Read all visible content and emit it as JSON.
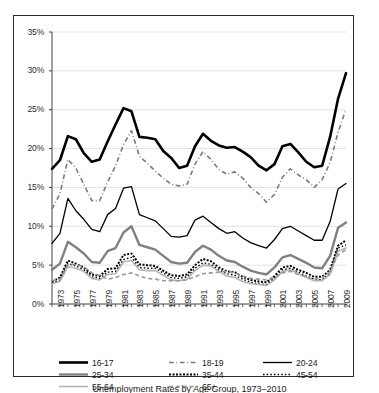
{
  "chart_data": {
    "type": "line",
    "title": "",
    "xlabel": "",
    "ylabel": "",
    "ylim": [
      0,
      35
    ],
    "xlim": [
      1973,
      2010
    ],
    "grid": true,
    "grid_axis": "y",
    "legend_position": "bottom",
    "ytick_labels": [
      "35%",
      "30%",
      "25%",
      "20%",
      "15%",
      "10%",
      "5%",
      "0%"
    ],
    "ytick_values": [
      35,
      30,
      25,
      20,
      15,
      10,
      5,
      0
    ],
    "xtick_labels": [
      "1973",
      "1975",
      "1977",
      "1979",
      "1981",
      "1983",
      "1985",
      "1987",
      "1989",
      "1991",
      "1993",
      "1995",
      "1997",
      "1999",
      "2001",
      "2003",
      "2005",
      "2007",
      "2009"
    ],
    "xtick_values": [
      1973,
      1975,
      1977,
      1979,
      1981,
      1983,
      1985,
      1987,
      1989,
      1991,
      1993,
      1995,
      1997,
      1999,
      2001,
      2003,
      2005,
      2007,
      2009
    ],
    "x": [
      1973,
      1974,
      1975,
      1976,
      1977,
      1978,
      1979,
      1980,
      1981,
      1982,
      1983,
      1984,
      1985,
      1986,
      1987,
      1988,
      1989,
      1990,
      1991,
      1992,
      1993,
      1994,
      1995,
      1996,
      1997,
      1998,
      1999,
      2000,
      2001,
      2002,
      2003,
      2004,
      2005,
      2006,
      2007,
      2008,
      2009,
      2010
    ],
    "series": [
      {
        "name": "16-17",
        "style": "solid",
        "width": 2.6,
        "color": "#000000",
        "values": [
          17.4,
          18.5,
          21.6,
          21.2,
          19.4,
          18.3,
          18.6,
          20.9,
          23.1,
          25.2,
          24.8,
          21.5,
          21.4,
          21.2,
          19.7,
          18.8,
          17.5,
          17.8,
          20.3,
          21.9,
          21.0,
          20.4,
          20.1,
          20.2,
          19.6,
          18.9,
          17.8,
          17.2,
          18.0,
          20.3,
          20.6,
          19.5,
          18.3,
          17.6,
          17.8,
          21.5,
          26.4,
          29.7
        ]
      },
      {
        "name": "18-19",
        "style": "dashdot",
        "width": 1.6,
        "color": "#7a7a7a",
        "values": [
          12.2,
          14.2,
          18.6,
          17.5,
          15.4,
          13.3,
          13.3,
          15.7,
          17.8,
          20.5,
          22.3,
          19.0,
          18.1,
          17.1,
          16.2,
          15.4,
          15.2,
          15.4,
          18.0,
          19.6,
          18.6,
          17.3,
          16.7,
          17.0,
          16.2,
          15.0,
          14.2,
          13.1,
          14.1,
          16.3,
          17.4,
          16.6,
          16.0,
          15.0,
          16.0,
          18.2,
          22.1,
          25.1
        ]
      },
      {
        "name": "20-24",
        "style": "solid",
        "width": 1.3,
        "color": "#000000",
        "values": [
          7.8,
          9.1,
          13.6,
          12.0,
          10.9,
          9.6,
          9.3,
          11.5,
          12.3,
          14.9,
          15.1,
          11.5,
          11.1,
          10.7,
          9.7,
          8.7,
          8.6,
          8.8,
          10.8,
          11.3,
          10.5,
          9.7,
          9.1,
          9.3,
          8.5,
          7.9,
          7.5,
          7.2,
          8.3,
          9.7,
          10.0,
          9.4,
          8.8,
          8.2,
          8.2,
          10.6,
          14.8,
          15.5
        ]
      },
      {
        "name": "25-34",
        "style": "solid",
        "width": 2.4,
        "color": "#808080",
        "values": [
          4.4,
          5.2,
          8.0,
          7.3,
          6.5,
          5.4,
          5.3,
          6.8,
          7.2,
          9.2,
          10.0,
          7.6,
          7.3,
          7.0,
          6.2,
          5.4,
          5.2,
          5.3,
          6.7,
          7.5,
          7.0,
          6.2,
          5.6,
          5.4,
          4.8,
          4.3,
          4.0,
          3.8,
          4.7,
          6.0,
          6.3,
          5.8,
          5.3,
          4.7,
          4.6,
          6.2,
          9.8,
          10.5
        ]
      },
      {
        "name": "35-44",
        "style": "dotted-heavy",
        "width": 2.0,
        "color": "#000000",
        "values": [
          2.9,
          3.4,
          5.6,
          5.2,
          4.7,
          3.8,
          3.6,
          4.5,
          4.6,
          6.3,
          6.5,
          5.1,
          5.0,
          4.9,
          4.3,
          3.7,
          3.6,
          3.8,
          5.0,
          5.8,
          5.5,
          4.7,
          4.2,
          4.1,
          3.5,
          3.1,
          2.9,
          2.8,
          3.6,
          4.7,
          4.9,
          4.4,
          4.0,
          3.5,
          3.5,
          4.4,
          7.5,
          8.2
        ]
      },
      {
        "name": "45-54",
        "style": "dotted-fine",
        "width": 1.4,
        "color": "#000000",
        "values": [
          2.7,
          3.1,
          5.2,
          4.9,
          4.4,
          3.5,
          3.3,
          4.1,
          4.2,
          5.7,
          6.0,
          4.7,
          4.6,
          4.6,
          4.0,
          3.4,
          3.3,
          3.5,
          4.6,
          5.3,
          5.1,
          4.4,
          3.9,
          3.7,
          3.2,
          2.8,
          2.6,
          2.5,
          3.3,
          4.4,
          4.6,
          4.1,
          3.6,
          3.2,
          3.1,
          4.0,
          7.2,
          7.6
        ]
      },
      {
        "name": "55-64",
        "style": "solid",
        "width": 1.6,
        "color": "#b3b3b3",
        "values": [
          2.6,
          2.9,
          4.8,
          4.6,
          4.2,
          3.3,
          3.1,
          3.8,
          3.9,
          5.4,
          5.6,
          4.4,
          4.3,
          4.3,
          3.7,
          3.1,
          3.0,
          3.2,
          4.3,
          5.0,
          4.9,
          4.2,
          3.6,
          3.4,
          2.9,
          2.6,
          2.5,
          2.4,
          3.1,
          4.2,
          4.4,
          3.9,
          3.4,
          3.0,
          3.0,
          3.8,
          6.8,
          7.2
        ]
      },
      {
        "name": "65+",
        "style": "dashed",
        "width": 1.6,
        "color": "#9a9a9a",
        "values": [
          3.0,
          3.2,
          5.0,
          5.1,
          4.8,
          4.0,
          3.7,
          3.2,
          3.4,
          3.8,
          4.0,
          3.6,
          3.3,
          3.2,
          3.0,
          3.0,
          3.0,
          3.1,
          3.5,
          3.9,
          4.0,
          4.1,
          4.2,
          4.0,
          3.6,
          3.3,
          3.2,
          3.1,
          3.4,
          4.0,
          4.2,
          3.8,
          3.5,
          3.2,
          3.3,
          4.2,
          6.3,
          7.0
        ]
      }
    ]
  },
  "legend": {
    "rows": [
      [
        {
          "label": "16-17",
          "key": "16-17"
        },
        {
          "label": "18-19",
          "key": "18-19"
        },
        {
          "label": "20-24",
          "key": "20-24"
        }
      ],
      [
        {
          "label": "25-34",
          "key": "25-34"
        },
        {
          "label": "35-44",
          "key": "35-44"
        },
        {
          "label": "45-54",
          "key": "45-54"
        }
      ],
      [
        {
          "label": "55-64",
          "key": "55-64"
        },
        {
          "label": "65+",
          "key": "65+"
        }
      ]
    ]
  },
  "caption": {
    "text": "Unemployment Rates by Age Group, 1973–2010"
  },
  "colors": {
    "axis": "#2c2c2c",
    "grid": "#d9d9d9",
    "frame": "#2b2b2b",
    "text": "#1a1a1a"
  }
}
